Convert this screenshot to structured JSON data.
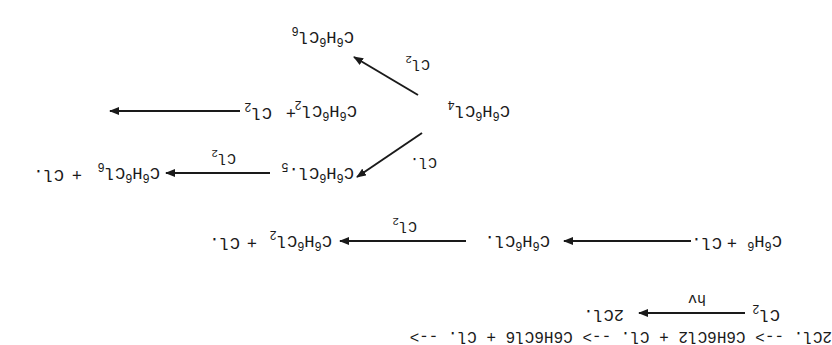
{
  "diagram": {
    "orientation": "rotated 180 degrees",
    "colors": {
      "ink": "#1a1a1a",
      "background": "#ffffff"
    },
    "species": {
      "cl2": {
        "base": "Cl",
        "sub": "2"
      },
      "two_cl_radical": {
        "text": "2Cl."
      },
      "c6h6": {
        "c": "C",
        "n1": "6",
        "h": "H",
        "n2": "6"
      },
      "cl_radical": {
        "text": "Cl."
      },
      "c6h6cl_radical": {
        "c": "C",
        "n1": "6",
        "h": "H",
        "n2": "6",
        "cl": "Cl.",
        "n3": ""
      },
      "c6h6cl2": {
        "c": "C",
        "n1": "6",
        "h": "H",
        "n2": "6",
        "cl": "Cl",
        "n3": "2"
      },
      "c6h6cl4": {
        "c": "C",
        "n1": "6",
        "h": "H",
        "n2": "6",
        "cl": "Cl",
        "n3": "4"
      },
      "c6h6cl5_radical": {
        "c": "C",
        "n1": "6",
        "h": "H",
        "n2": "6",
        "cl": "Cl.",
        "n3": "5"
      },
      "c6h6cl6": {
        "c": "C",
        "n1": "6",
        "h": "H",
        "n2": "6",
        "cl": "Cl",
        "n3": "6"
      }
    },
    "plus": "+",
    "reactions": [
      {
        "id": "initiation",
        "reactants": [
          "Cl2"
        ],
        "products": [
          "2Cl."
        ],
        "condition": "hv"
      },
      {
        "id": "step1",
        "reactants": [
          "C6H6",
          "Cl."
        ],
        "products": [
          "C6H6Cl."
        ],
        "condition": ""
      },
      {
        "id": "step2",
        "reactants": [
          "C6H6Cl."
        ],
        "products": [
          "C6H6Cl2",
          "Cl."
        ],
        "condition": "Cl2"
      },
      {
        "id": "step3",
        "reactants": [
          "C6H6Cl2",
          "Cl2"
        ],
        "products": [
          "C6H6Cl4"
        ],
        "condition": ""
      },
      {
        "id": "step4a",
        "reactants": [
          "C6H6Cl4"
        ],
        "products": [
          "C6H6Cl6"
        ],
        "condition": "Cl2"
      },
      {
        "id": "step4b",
        "reactants": [
          "C6H6Cl4"
        ],
        "products": [
          "C6H6Cl5."
        ],
        "condition": "Cl."
      },
      {
        "id": "step5",
        "reactants": [
          "C6H6Cl5."
        ],
        "products": [
          "C6H6Cl6",
          "Cl."
        ],
        "condition": "Cl2"
      }
    ],
    "arrow_labels": {
      "hv": "hv",
      "cl2": {
        "base": "Cl",
        "sub": "2"
      },
      "cl_radical": "Cl."
    }
  }
}
